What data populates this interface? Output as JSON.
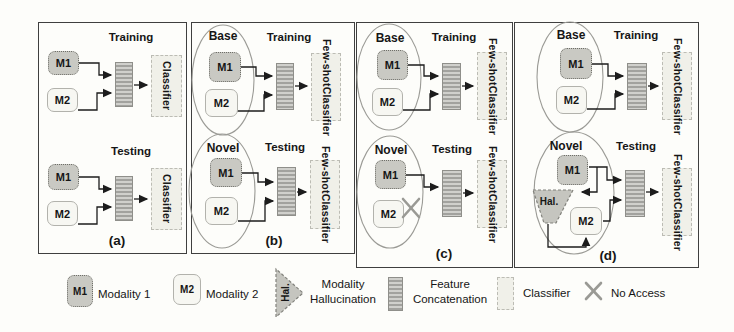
{
  "labels": {
    "training": "Training",
    "testing": "Testing",
    "base": "Base",
    "novel": "Novel",
    "m1": "M1",
    "m2": "M2",
    "classifier": "Classifier",
    "few_shot": "Few-shot",
    "hal": "Hal.",
    "panel_a": "(a)",
    "panel_b": "(b)",
    "panel_c": "(c)",
    "panel_d": "(d)"
  },
  "legend": {
    "m1_symbol": "M1",
    "m1_label": "Modality 1",
    "m2_symbol": "M2",
    "m2_label": "Modality 2",
    "hal_symbol": "Hal.",
    "hal_label": "Modality Hallucination",
    "concat_label": "Feature Concatenation",
    "classifier_label": "Classifier",
    "no_access_label": "No Access"
  },
  "icons": {
    "no_access": "gray-x-mark",
    "hallucination": "funnel-triangle",
    "concatenation": "striped-vertical-bar"
  },
  "colors": {
    "m1_fill": "#c9c9c3",
    "m2_fill": "#f7f7f2",
    "classifier_fill": "#f0f0e9",
    "bar_light": "#d0d0cc",
    "bar_dark": "#a2a29e",
    "panel_border": "#3f3f3f",
    "ellipse_stroke": "#9b9b96",
    "arrow": "#1c1c1c",
    "x_mark": "#9a9a95"
  }
}
